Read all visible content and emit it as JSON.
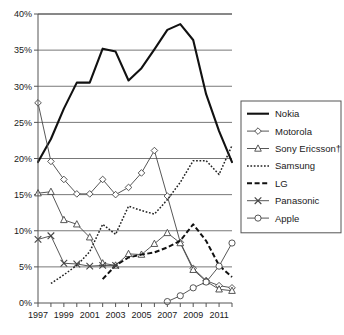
{
  "chart_data": {
    "type": "line",
    "title": "",
    "subtitle": "",
    "xlabel": "",
    "ylabel": "",
    "xlim": [
      1997,
      2012
    ],
    "ylim": [
      0,
      40
    ],
    "grid": true,
    "legend_position": "right",
    "x": [
      1997,
      1998,
      1999,
      2000,
      2001,
      2002,
      2003,
      2004,
      2005,
      2006,
      2007,
      2008,
      2009,
      2010,
      2011,
      2012
    ],
    "x_ticks": [
      1997,
      1998,
      1999,
      2000,
      2001,
      2002,
      2003,
      2004,
      2005,
      2006,
      2007,
      2008,
      2009,
      2010,
      2011,
      2012
    ],
    "x_tick_labels": [
      "1997",
      "",
      "1999",
      "",
      "2001",
      "",
      "2003",
      "",
      "2005",
      "",
      "2007",
      "",
      "2009",
      "",
      "2011",
      ""
    ],
    "y_ticks": [
      0,
      5,
      10,
      15,
      20,
      25,
      30,
      35,
      40
    ],
    "y_tick_labels": [
      "0%",
      "5%",
      "10%",
      "15%",
      "20%",
      "25%",
      "30%",
      "35%",
      "40%"
    ],
    "series": [
      {
        "name": "Nokia",
        "marker": "none",
        "line_style": "solid",
        "line_width": 2.1,
        "color": "#111111",
        "x": [
          1997,
          1998,
          1999,
          2000,
          2001,
          2002,
          2003,
          2004,
          2005,
          2006,
          2007,
          2008,
          2009,
          2010,
          2011,
          2012
        ],
        "values": [
          19.5,
          22.7,
          26.9,
          30.5,
          30.5,
          35.2,
          34.8,
          30.8,
          32.5,
          35.1,
          37.8,
          38.6,
          36.4,
          28.9,
          23.8,
          19.5
        ]
      },
      {
        "name": "Motorola",
        "marker": "diamond",
        "line_style": "solid",
        "line_width": 0.9,
        "color": "#444444",
        "x": [
          1997,
          1998,
          1999,
          2000,
          2001,
          2002,
          2003,
          2004,
          2005,
          2006,
          2007,
          2008,
          2009,
          2010,
          2011,
          2012
        ],
        "values": [
          27.7,
          19.6,
          17.1,
          15.1,
          15.1,
          17.1,
          15.0,
          16.0,
          18.0,
          21.1,
          14.8,
          8.4,
          4.8,
          3.1,
          2.4,
          2.1
        ]
      },
      {
        "name": "Sony Ericsson†",
        "marker": "triangle",
        "line_style": "solid",
        "line_width": 0.9,
        "color": "#444444",
        "x": [
          1997,
          1998,
          1999,
          2000,
          2001,
          2002,
          2003,
          2004,
          2005,
          2006,
          2007,
          2008,
          2009,
          2010,
          2011,
          2012
        ],
        "values": [
          15.2,
          15.4,
          11.5,
          10.9,
          9.1,
          5.5,
          5.2,
          6.8,
          6.7,
          8.2,
          9.7,
          8.3,
          4.6,
          3.0,
          1.9,
          1.7
        ]
      },
      {
        "name": "Samsung",
        "marker": "none",
        "line_style": "dotted",
        "line_width": 1.5,
        "color": "#222222",
        "x": [
          1998,
          1999,
          2000,
          2001,
          2002,
          2003,
          2004,
          2005,
          2006,
          2007,
          2008,
          2009,
          2010,
          2011,
          2012
        ],
        "values": [
          2.7,
          3.9,
          5.2,
          7.1,
          10.9,
          9.5,
          13.4,
          12.8,
          12.3,
          14.3,
          16.7,
          19.7,
          19.7,
          17.8,
          21.8
        ]
      },
      {
        "name": "LG",
        "marker": "none",
        "line_style": "dashed",
        "line_width": 2.0,
        "color": "#111111",
        "x": [
          2002,
          2003,
          2004,
          2005,
          2006,
          2007,
          2008,
          2009,
          2010,
          2011,
          2012
        ],
        "values": [
          3.3,
          5.2,
          6.3,
          6.7,
          7.0,
          7.7,
          8.6,
          10.9,
          8.6,
          5.2,
          3.6
        ]
      },
      {
        "name": "Panasonic",
        "marker": "x",
        "line_style": "solid",
        "line_width": 0.9,
        "color": "#444444",
        "x": [
          1997,
          1998,
          1999,
          2000,
          2001,
          2002,
          2003
        ],
        "values": [
          8.8,
          9.3,
          5.5,
          5.4,
          5.1,
          5.2,
          5.2
        ]
      },
      {
        "name": "Apple",
        "marker": "circle",
        "line_style": "solid",
        "line_width": 0.9,
        "color": "#444444",
        "x": [
          2007,
          2008,
          2009,
          2010,
          2011,
          2012
        ],
        "values": [
          0.2,
          1.0,
          2.1,
          2.9,
          5.1,
          8.3
        ]
      }
    ],
    "legend": [
      {
        "label": "Nokia"
      },
      {
        "label": "Motorola"
      },
      {
        "label": "Sony Ericsson†"
      },
      {
        "label": "Samsung"
      },
      {
        "label": "LG"
      },
      {
        "label": "Panasonic"
      },
      {
        "label": "Apple"
      }
    ],
    "colors": {
      "axis": "#555555",
      "grid": "#555555",
      "background": "#ffffff",
      "primary_line": "#111111",
      "marker_line": "#444444"
    }
  }
}
